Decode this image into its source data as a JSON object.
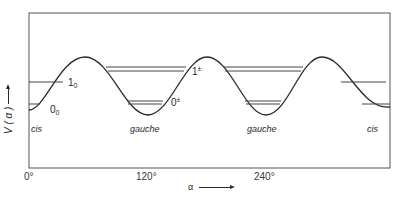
{
  "diagram": {
    "y_axis_label": "V ( α )",
    "x_axis_label": "α",
    "x_ticks": [
      "0°",
      "120°",
      "240°"
    ],
    "well_labels": {
      "cis_left": "cis",
      "gauche_1": "gauche",
      "gauche_2": "gauche",
      "cis_right": "cis"
    },
    "levels": {
      "one_zero": {
        "main": "1",
        "sub": "0"
      },
      "zero_zero": {
        "main": "0",
        "sub": "0"
      },
      "one_pm": {
        "main": "1",
        "sup": "±"
      },
      "zero_pm": {
        "main": "0",
        "sup": "±"
      }
    },
    "line_color": "#2a2a2a",
    "frame_color": "#555555"
  }
}
